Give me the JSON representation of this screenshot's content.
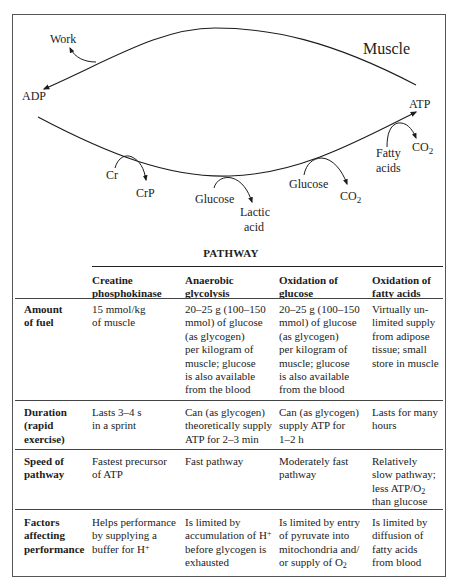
{
  "diagram": {
    "region_label": "Muscle",
    "labels": {
      "work": "Work",
      "adp": "ADP",
      "atp": "ATP",
      "cr": "Cr",
      "crp": "CrP",
      "glucose_anaerobic": "Glucose",
      "lactic": "Lactic",
      "acid": "acid",
      "glucose_oxidative": "Glucose",
      "co2_glucose": "CO",
      "co2_glucose_sub": "2",
      "fatty": "Fatty",
      "acids": "acids",
      "co2_fatty": "CO",
      "co2_fatty_sub": "2"
    }
  },
  "table": {
    "group_header": "PATHWAY",
    "columns": [
      {
        "line1": "Creatine",
        "line2": "phosphokinase"
      },
      {
        "line1": "Anaerobic",
        "line2": "glycolysis"
      },
      {
        "line1": "Oxidation of",
        "line2": "glucose"
      },
      {
        "line1": "Oxidation of",
        "line2": "fatty acids"
      }
    ],
    "rows": [
      {
        "label": [
          "Amount",
          "of fuel"
        ],
        "cells": [
          [
            "15 mmol/kg",
            "of muscle"
          ],
          [
            "20–25 g (100–150",
            "mmol) of glucose",
            "(as glycogen)",
            "per kilogram of",
            "muscle; glucose",
            "is also available",
            "from the blood"
          ],
          [
            "20–25 g (100–150",
            "mmol) of glucose",
            "(as glycogen)",
            "per kilogram of",
            "muscle; glucose",
            "is also available",
            "from the blood"
          ],
          [
            "Virtually un-",
            "limited supply",
            "from adipose",
            "tissue; small",
            "store in muscle"
          ]
        ]
      },
      {
        "label": [
          "Duration",
          "(rapid",
          "exercise)"
        ],
        "cells": [
          [
            "Lasts 3–4 s",
            "in a sprint"
          ],
          [
            "Can (as glycogen)",
            "theoretically supply",
            "ATP for 2–3 min"
          ],
          [
            "Can (as glycogen)",
            "supply ATP for",
            "1–2 h"
          ],
          [
            "Lasts for many",
            "hours"
          ]
        ]
      },
      {
        "label": [
          "Speed of",
          "pathway"
        ],
        "cells": [
          [
            "Fastest precursor",
            "of ATP"
          ],
          [
            "Fast pathway"
          ],
          [
            "Moderately fast",
            "pathway"
          ],
          [
            "Relatively",
            "slow pathway;",
            "less ATP/O",
            "than glucose"
          ]
        ],
        "speed_fatty_sub": "2"
      },
      {
        "label": [
          "Factors",
          "affecting",
          "performance"
        ],
        "cells": [
          [
            "Helps performance",
            "by supplying a",
            "buffer for H"
          ],
          [
            "Is limited by",
            "accumulation of H",
            "before glycogen is",
            "exhausted"
          ],
          [
            "Is limited by entry",
            "of pyruvate into",
            "mitochondria and/",
            "or supply of O"
          ],
          [
            "Is limited by",
            "diffusion of",
            "fatty acids",
            "from blood"
          ]
        ],
        "h_plus_sup": "+",
        "o2_sub": "2"
      }
    ]
  }
}
